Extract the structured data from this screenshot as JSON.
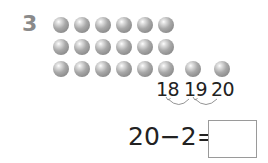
{
  "question": {
    "number": "3",
    "balls": {
      "rows": [
        {
          "count": 6
        },
        {
          "count": 6
        },
        {
          "count": 6
        }
      ],
      "extra_balls": 2,
      "total": 20,
      "color": "#999999"
    },
    "number_line": {
      "labels": [
        "18",
        "19",
        "20"
      ],
      "arrows": [
        {
          "from": "20",
          "to": "19"
        },
        {
          "from": "19",
          "to": "18"
        }
      ]
    },
    "equation": {
      "text": "20−2=",
      "answer": ""
    }
  }
}
